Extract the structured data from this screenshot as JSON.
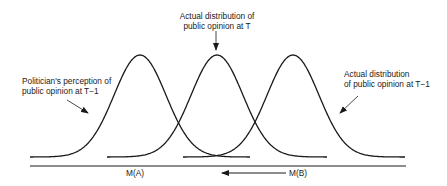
{
  "diagram": {
    "type": "shifting-normal-distributions",
    "curves": [
      {
        "id": "politician-perception-t-minus-1",
        "peak_x": 140,
        "foot_left": 30,
        "foot_right": 250
      },
      {
        "id": "actual-distribution-t",
        "peak_x": 217,
        "foot_left": 107,
        "foot_right": 327
      },
      {
        "id": "actual-distribution-t-minus-1",
        "peak_x": 293,
        "foot_left": 183,
        "foot_right": 405
      }
    ],
    "labels": {
      "politician_perception": {
        "line1": "Politician's perception of",
        "line2": "public opinion at T−1"
      },
      "actual_t": {
        "line1": "Actual distribution of",
        "line2": "public opinion at T"
      },
      "actual_t_minus_1": {
        "line1": "Actual distribution",
        "line2": "of public opinion at T−1"
      }
    },
    "axis": {
      "marker_a": "M(A)",
      "marker_b": "M(B)",
      "shift_direction": "left"
    },
    "colors": {
      "ink": "#1a1a1a",
      "background": "#ffffff"
    }
  }
}
